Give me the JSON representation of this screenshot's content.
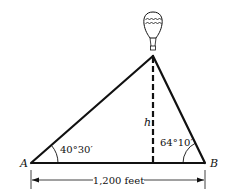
{
  "diagram": {
    "type": "triangle-height-problem",
    "vertices": {
      "left_label": "A",
      "right_label": "B"
    },
    "angles": {
      "at_A": "40°30′",
      "at_B": "64°10′"
    },
    "height_label": "h",
    "base_dimension": "1,200 feet",
    "object_at_apex": "hot-air-balloon",
    "colors": {
      "line": "#111111",
      "background": "#ffffff"
    }
  }
}
